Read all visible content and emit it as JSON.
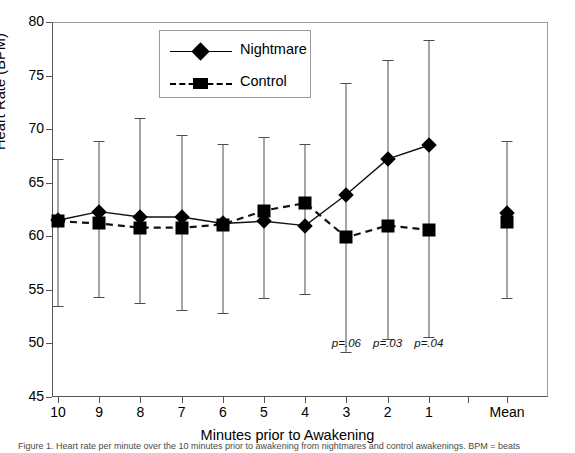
{
  "chart_data": {
    "type": "line",
    "title": "",
    "xlabel": "Minutes prior to Awakening",
    "ylabel": "Heart Rate (BPM)",
    "ylim": [
      45,
      80
    ],
    "yticks": [
      45,
      50,
      55,
      60,
      65,
      70,
      75,
      80
    ],
    "categories": [
      "10",
      "9",
      "8",
      "7",
      "6",
      "5",
      "4",
      "3",
      "2",
      "1",
      "Mean"
    ],
    "grid": false,
    "legend_position": "top-center",
    "series": [
      {
        "name": "Nightmare",
        "marker": "diamond",
        "linestyle": "solid",
        "values": [
          61.5,
          62.3,
          61.8,
          61.8,
          61.2,
          61.4,
          61.0,
          63.9,
          67.2,
          68.5,
          62.2
        ],
        "err_upper": [
          67.2,
          68.9,
          71.0,
          69.5,
          68.6,
          69.3,
          68.6,
          74.3,
          76.5,
          78.3,
          68.9
        ],
        "err_lower": [
          53.5,
          54.3,
          53.8,
          53.1,
          52.8,
          54.2,
          54.6,
          49.2,
          50.4,
          50.6,
          54.2
        ]
      },
      {
        "name": "Control",
        "marker": "square",
        "linestyle": "dashed",
        "values": [
          61.4,
          61.2,
          60.8,
          60.8,
          61.1,
          62.4,
          63.1,
          59.9,
          61.0,
          60.6,
          61.3
        ],
        "err_upper": [],
        "err_lower": []
      }
    ],
    "annotations": [
      {
        "text": "p=.06",
        "category": "3"
      },
      {
        "text": "p=.03",
        "category": "2"
      },
      {
        "text": "p=.04",
        "category": "1"
      }
    ]
  },
  "legend": {
    "items": [
      {
        "label": "Nightmare",
        "marker": "diamond-icon",
        "line": "solid-line-icon"
      },
      {
        "label": "Control",
        "marker": "square-icon",
        "line": "dashed-line-icon"
      }
    ]
  },
  "axes": {
    "y_title": "Heart Rate (BPM)",
    "x_title": "Minutes prior to Awakening",
    "y_ticks": [
      "80",
      "75",
      "70",
      "65",
      "60",
      "55",
      "50",
      "45"
    ],
    "x_ticks": [
      "10",
      "9",
      "8",
      "7",
      "6",
      "5",
      "4",
      "3",
      "2",
      "1",
      "Mean"
    ]
  },
  "caption": "Figure 1. Heart rate per minute over the 10 minutes prior to awakening from nightmares and control awakenings. BPM = beats"
}
